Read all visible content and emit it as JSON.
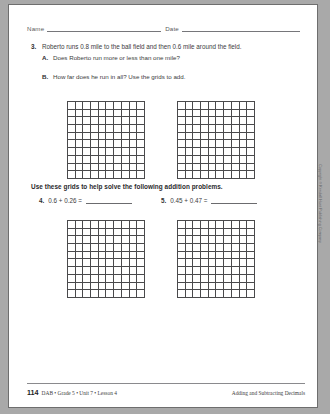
{
  "header": {
    "name_label": "Name",
    "date_label": "Date"
  },
  "problems": [
    {
      "number": "3.",
      "text": "Roberto runs 0.8 mile to the ball field and then 0.6 mile around the field.",
      "parts": [
        {
          "letter": "A.",
          "text": "Does Roberto run more or less than one mile?"
        },
        {
          "letter": "B.",
          "text": "How far does he run in all? Use the grids to add."
        }
      ]
    }
  ],
  "instruction": "Use these grids to help solve the following addition problems.",
  "addition_problems": [
    {
      "number": "4.",
      "expression": "0.6 + 0.26 ="
    },
    {
      "number": "5.",
      "expression": "0.45 + 0.47 ="
    }
  ],
  "grids": {
    "rows": 10,
    "columns": 10,
    "count": 4
  },
  "copyright": "Copyright © Kendall Hunt Publishing Company",
  "footer": {
    "page_number": "114",
    "source": "DAB • Grade 5 • Unit 7 • Lesson 4",
    "title": "Adding and Subtracting Decimals"
  },
  "colors": {
    "page_background": "#ffffff",
    "grid_line": "#4a4a4c",
    "text": "#3b3b3d"
  }
}
